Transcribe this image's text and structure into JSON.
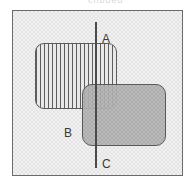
{
  "figure": {
    "caption_remnant": "clipped",
    "background_color": "#ffffff",
    "frame": {
      "name": "universe-box",
      "border_color": "#6b6b6b",
      "fill_color": "#e3e3e3",
      "x": 12,
      "y": 10,
      "width": 171,
      "height": 166
    },
    "shapes": [
      {
        "id": "set-a",
        "label": "A",
        "style": "vertical-hatch",
        "fill_color": "#e8e8e8",
        "hatch_color": "#5e5e5e",
        "border_color": "#5a5a5a",
        "x": 35,
        "y": 43,
        "width": 82,
        "height": 66,
        "corner_radius": 9
      },
      {
        "id": "set-b",
        "label": "B",
        "style": "solid-gray",
        "fill_color": "#a8a8a8",
        "border_color": "#4f4f4f",
        "x": 82,
        "y": 84,
        "width": 84,
        "height": 62,
        "corner_radius": 10
      }
    ],
    "divider": {
      "id": "line-c",
      "label": "C",
      "orientation": "vertical",
      "color": "#4a4a4a",
      "x": 95,
      "y_start": 22,
      "y_end": 167,
      "thickness": 2
    },
    "labels": [
      {
        "id": "label-a",
        "text": "A",
        "x": 102,
        "y": 33
      },
      {
        "id": "label-b",
        "text": "B",
        "x": 64,
        "y": 127
      },
      {
        "id": "label-c",
        "text": "C",
        "x": 102,
        "y": 158
      }
    ]
  }
}
